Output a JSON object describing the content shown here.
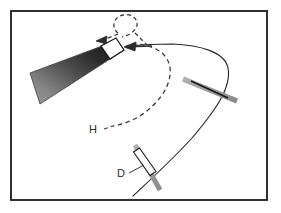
{
  "figure": {
    "background_color": "#ffffff",
    "border": {
      "color": "#1a1a1a",
      "x": 10,
      "y": 10,
      "width": 258,
      "height": 191,
      "stroke_width": 2
    },
    "labels": [
      {
        "id": "H",
        "text": "H",
        "x": 96,
        "y": 132
      },
      {
        "id": "D",
        "text": "D",
        "x": 121,
        "y": 176
      }
    ],
    "colors": {
      "stroke_dark": "#1a1a1a",
      "stroke_mid": "#3a3a3a",
      "bar_gray": "#9a9a9a",
      "cone_light": "#8e8e8e",
      "cone_dark": "#2a2a2a",
      "white": "#ffffff"
    },
    "shapes": {
      "cone": {
        "name": "gradient-cone-wedge",
        "points": "30,73 39,104 112,60 103,46",
        "gradient_from": "#8d8d8d",
        "gradient_to": "#262626"
      },
      "tip_rectangle": {
        "name": "white-tip-rectangle",
        "points": "103,47 110,57 124,48 117,39"
      },
      "dashed_loop": {
        "name": "dashed-loop-path",
        "cx": 124,
        "cy": 24,
        "r": 9
      },
      "arrow_left_upper": {
        "name": "arrow-left-upper",
        "tip_x": 97,
        "tip_y": 40
      },
      "arrow_left_lower": {
        "name": "arrow-left-lower",
        "tip_x": 124,
        "tip_y": 48
      },
      "cross_upper": {
        "name": "cross-marker-upper",
        "cx": 208,
        "cy": 89
      },
      "cross_lower": {
        "name": "cross-marker-lower",
        "cx": 146,
        "cy": 166
      }
    }
  }
}
